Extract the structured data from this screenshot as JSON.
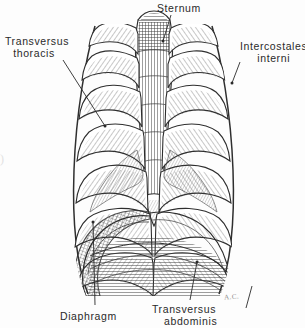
{
  "figure": {
    "style": "pen-and-ink hatched anatomical line drawing",
    "background_color": "#fdfdfd",
    "ink_color": "#2f2f2f",
    "label_color": "#2a2a2a",
    "signature": "A.C.",
    "edge_mark": ")"
  },
  "labels": [
    {
      "id": "sternum",
      "name": "sternum",
      "line1": "Sternum",
      "line2": "",
      "leader": {
        "x1": 171,
        "y1": 15,
        "x2": 163,
        "y2": 41,
        "dot_x": 163,
        "dot_y": 41
      }
    },
    {
      "id": "transversus-thoracis",
      "name": "transversus-thoracis",
      "line1": "Transversus",
      "line2": "thoracis",
      "leader": {
        "x1": 63,
        "y1": 60,
        "x2": 105,
        "y2": 126,
        "dot_x": 105,
        "dot_y": 126
      }
    },
    {
      "id": "intercostales-interni",
      "name": "intercostales-interni",
      "line1": "Intercostales",
      "line2": "interni",
      "leader": {
        "x1": 240,
        "y1": 62,
        "x2": 232,
        "y2": 83,
        "dot_x": 232,
        "dot_y": 83
      }
    },
    {
      "id": "diaphragm",
      "name": "diaphragm",
      "line1": "Diaphragm",
      "line2": "",
      "leader": {
        "x1": 95,
        "y1": 305,
        "x2": 93,
        "y2": 222,
        "dot_x": 93,
        "dot_y": 222
      }
    },
    {
      "id": "transversus-abdominis",
      "name": "transversus-abdominis",
      "line1": "Transversus",
      "line2": "abdominis",
      "leader": {
        "x1": 190,
        "y1": 300,
        "x2": 197,
        "y2": 262,
        "dot_x": 197,
        "dot_y": 262
      }
    }
  ]
}
